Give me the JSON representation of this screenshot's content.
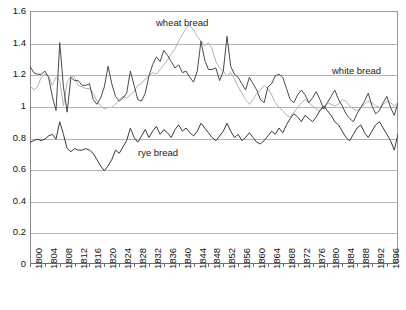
{
  "chart_data": {
    "type": "line",
    "title": "",
    "xlabel": "",
    "ylabel": "",
    "xlim": [
      1800,
      1899
    ],
    "ylim": [
      0,
      1.6
    ],
    "grid": true,
    "legend_position": "inline-annotations",
    "ytick_labels": [
      "1.6",
      "1.4",
      "1.2",
      "1",
      "0.8",
      "0.6",
      "0.4",
      "0.2",
      "0"
    ],
    "ytick_values": [
      1.6,
      1.4,
      1.2,
      1.0,
      0.8,
      0.6,
      0.4,
      0.2,
      0
    ],
    "xtick_labels": [
      "1800",
      "1804",
      "1808",
      "1812",
      "1816",
      "1820",
      "1824",
      "1828",
      "1832",
      "1836",
      "1840",
      "1844",
      "1848",
      "1852",
      "1856",
      "1860",
      "1864",
      "1868",
      "1872",
      "1876",
      "1880",
      "1884",
      "1888",
      "1892",
      "1896"
    ],
    "xtick_values": [
      1800,
      1804,
      1808,
      1812,
      1816,
      1820,
      1824,
      1828,
      1832,
      1836,
      1840,
      1844,
      1848,
      1852,
      1856,
      1860,
      1864,
      1868,
      1872,
      1876,
      1880,
      1884,
      1888,
      1892,
      1896
    ],
    "annotations": [
      {
        "text": "wheat bread",
        "series": "wheat bread"
      },
      {
        "text": "white bread",
        "series": "white bread"
      },
      {
        "text": "rye bread",
        "series": "rye bread"
      }
    ],
    "series": [
      {
        "name": "wheat bread",
        "color": "#b3b3b3",
        "x": [
          1800,
          1801,
          1802,
          1803,
          1804,
          1805,
          1806,
          1807,
          1808,
          1809,
          1810,
          1811,
          1812,
          1813,
          1814,
          1815,
          1816,
          1817,
          1818,
          1819,
          1820,
          1821,
          1822,
          1823,
          1824,
          1825,
          1826,
          1827,
          1828,
          1829,
          1830,
          1831,
          1832,
          1833,
          1834,
          1835,
          1836,
          1837,
          1838,
          1839,
          1840,
          1841,
          1842,
          1843,
          1844,
          1845,
          1846,
          1847,
          1848,
          1849,
          1850,
          1851,
          1852,
          1853,
          1854,
          1855,
          1856,
          1857,
          1858,
          1859,
          1860,
          1861,
          1862,
          1863,
          1864,
          1865,
          1866,
          1867,
          1868,
          1869,
          1870,
          1871,
          1872,
          1873,
          1874,
          1875,
          1876,
          1877,
          1878,
          1879,
          1880,
          1881,
          1882,
          1883,
          1884,
          1885,
          1886,
          1887,
          1888,
          1889,
          1890,
          1891,
          1892,
          1893,
          1894,
          1895,
          1896,
          1897,
          1898,
          1899
        ],
        "values": [
          1.13,
          1.1,
          1.12,
          1.18,
          1.2,
          1.19,
          1.13,
          1.18,
          1.16,
          1.0,
          1.15,
          1.19,
          1.18,
          1.13,
          1.12,
          1.11,
          1.11,
          1.08,
          1.03,
          1.0,
          0.98,
          0.99,
          0.99,
          1.01,
          1.04,
          1.06,
          1.05,
          1.07,
          1.09,
          1.13,
          1.14,
          1.17,
          1.19,
          1.21,
          1.2,
          1.23,
          1.26,
          1.29,
          1.33,
          1.36,
          1.41,
          1.45,
          1.49,
          1.51,
          1.48,
          1.44,
          1.41,
          1.38,
          1.4,
          1.36,
          1.28,
          1.24,
          1.22,
          1.19,
          1.21,
          1.17,
          1.12,
          1.08,
          1.04,
          1.01,
          1.04,
          1.08,
          1.1,
          1.13,
          1.11,
          1.07,
          1.02,
          0.99,
          0.97,
          0.94,
          0.93,
          0.96,
          0.99,
          1.02,
          1.04,
          1.02,
          1.0,
          0.98,
          0.97,
          0.99,
          1.02,
          1.01,
          1.0,
          1.01,
          1.04,
          1.03,
          1.0,
          0.98,
          0.97,
          0.99,
          1.01,
          1.03,
          1.02,
          1.0,
          0.99,
          1.01,
          1.03,
          1.02,
          1.0,
          1.02
        ]
      },
      {
        "name": "white bread",
        "color": "#4a4a4a",
        "x": [
          1800,
          1801,
          1802,
          1803,
          1804,
          1805,
          1806,
          1807,
          1808,
          1809,
          1810,
          1811,
          1812,
          1813,
          1814,
          1815,
          1816,
          1817,
          1818,
          1819,
          1820,
          1821,
          1822,
          1823,
          1824,
          1825,
          1826,
          1827,
          1828,
          1829,
          1830,
          1831,
          1832,
          1833,
          1834,
          1835,
          1836,
          1837,
          1838,
          1839,
          1840,
          1841,
          1842,
          1843,
          1844,
          1845,
          1846,
          1847,
          1848,
          1849,
          1850,
          1851,
          1852,
          1853,
          1854,
          1855,
          1856,
          1857,
          1858,
          1859,
          1860,
          1861,
          1862,
          1863,
          1864,
          1865,
          1866,
          1867,
          1868,
          1869,
          1870,
          1871,
          1872,
          1873,
          1874,
          1875,
          1876,
          1877,
          1878,
          1879,
          1880,
          1881,
          1882,
          1883,
          1884,
          1885,
          1886,
          1887,
          1888,
          1889,
          1890,
          1891,
          1892,
          1893,
          1894,
          1895,
          1896,
          1897,
          1898,
          1899
        ],
        "values": [
          1.25,
          1.21,
          1.2,
          1.2,
          1.22,
          1.18,
          1.06,
          0.97,
          1.4,
          1.12,
          0.96,
          1.18,
          1.16,
          1.16,
          1.13,
          1.13,
          1.14,
          1.04,
          1.01,
          1.05,
          1.12,
          1.25,
          1.14,
          1.06,
          1.03,
          1.05,
          1.08,
          1.22,
          1.13,
          1.04,
          1.03,
          1.08,
          1.19,
          1.26,
          1.31,
          1.28,
          1.35,
          1.32,
          1.28,
          1.24,
          1.26,
          1.21,
          1.22,
          1.18,
          1.15,
          1.22,
          1.41,
          1.29,
          1.23,
          1.23,
          1.24,
          1.16,
          1.22,
          1.44,
          1.25,
          1.2,
          1.18,
          1.14,
          1.1,
          1.18,
          1.14,
          1.1,
          1.04,
          1.02,
          1.12,
          1.14,
          1.19,
          1.2,
          1.18,
          1.11,
          1.04,
          1.02,
          1.07,
          1.1,
          1.07,
          1.02,
          1.05,
          1.09,
          1.04,
          0.98,
          1.02,
          1.06,
          1.1,
          1.04,
          1.0,
          0.95,
          0.92,
          0.9,
          0.95,
          0.99,
          1.03,
          1.08,
          1.0,
          0.95,
          0.97,
          1.02,
          1.06,
          0.99,
          0.94,
          1.02
        ]
      },
      {
        "name": "rye bread",
        "color": "#3a3a3a",
        "x": [
          1800,
          1801,
          1802,
          1803,
          1804,
          1805,
          1806,
          1807,
          1808,
          1809,
          1810,
          1811,
          1812,
          1813,
          1814,
          1815,
          1816,
          1817,
          1818,
          1819,
          1820,
          1821,
          1822,
          1823,
          1824,
          1825,
          1826,
          1827,
          1828,
          1829,
          1830,
          1831,
          1832,
          1833,
          1834,
          1835,
          1836,
          1837,
          1838,
          1839,
          1840,
          1841,
          1842,
          1843,
          1844,
          1845,
          1846,
          1847,
          1848,
          1849,
          1850,
          1851,
          1852,
          1853,
          1854,
          1855,
          1856,
          1857,
          1858,
          1859,
          1860,
          1861,
          1862,
          1863,
          1864,
          1865,
          1866,
          1867,
          1868,
          1869,
          1870,
          1871,
          1872,
          1873,
          1874,
          1875,
          1876,
          1877,
          1878,
          1879,
          1880,
          1881,
          1882,
          1883,
          1884,
          1885,
          1886,
          1887,
          1888,
          1889,
          1890,
          1891,
          1892,
          1893,
          1894,
          1895,
          1896,
          1897,
          1898,
          1899
        ],
        "values": [
          0.77,
          0.78,
          0.79,
          0.78,
          0.79,
          0.81,
          0.82,
          0.79,
          0.9,
          0.82,
          0.73,
          0.71,
          0.73,
          0.72,
          0.72,
          0.73,
          0.72,
          0.7,
          0.66,
          0.62,
          0.59,
          0.62,
          0.66,
          0.72,
          0.7,
          0.74,
          0.78,
          0.86,
          0.8,
          0.77,
          0.81,
          0.85,
          0.8,
          0.84,
          0.87,
          0.82,
          0.85,
          0.83,
          0.8,
          0.85,
          0.88,
          0.84,
          0.86,
          0.83,
          0.81,
          0.84,
          0.89,
          0.86,
          0.83,
          0.8,
          0.78,
          0.81,
          0.84,
          0.89,
          0.84,
          0.8,
          0.82,
          0.78,
          0.8,
          0.83,
          0.8,
          0.77,
          0.76,
          0.78,
          0.81,
          0.84,
          0.82,
          0.86,
          0.83,
          0.88,
          0.92,
          0.95,
          0.93,
          0.9,
          0.94,
          0.92,
          0.9,
          0.93,
          0.97,
          1.0,
          0.97,
          0.94,
          0.9,
          0.88,
          0.84,
          0.8,
          0.78,
          0.82,
          0.86,
          0.88,
          0.83,
          0.8,
          0.84,
          0.88,
          0.9,
          0.86,
          0.82,
          0.78,
          0.72,
          0.82
        ]
      }
    ]
  }
}
